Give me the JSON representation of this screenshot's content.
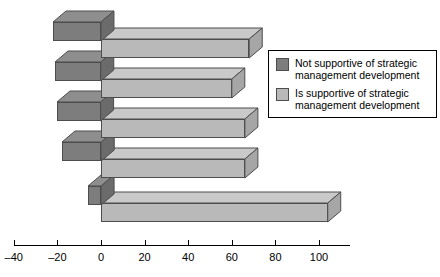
{
  "chart_data": {
    "type": "bar",
    "orientation": "horizontal",
    "style": "3d-stacked-rows",
    "title": "",
    "xlabel": "",
    "ylabel": "",
    "xlim": [
      -40,
      110
    ],
    "xticks": [
      -40,
      -20,
      0,
      20,
      40,
      60,
      80,
      100
    ],
    "xtick_labels": [
      "–40",
      "–20",
      "0",
      "20",
      "40",
      "60",
      "80",
      "100"
    ],
    "grid": false,
    "categories": [
      "Row 1",
      "Row 2",
      "Row 3",
      "Row 4",
      "Row 5"
    ],
    "series": [
      {
        "name": "Not supportive of strategic management development",
        "color": "#7d7d7d",
        "top_color": "#8e8e8e",
        "side_color": "#6b6b6b",
        "values": [
          -22,
          -21,
          -20,
          -18,
          -6
        ]
      },
      {
        "name": "Is supportive of strategic management development",
        "color": "#b9b9b9",
        "top_color": "#c9c9c9",
        "side_color": "#a6a6a6",
        "values": [
          68,
          60,
          66,
          66,
          104
        ]
      }
    ],
    "legend": {
      "position": "right",
      "entries": [
        {
          "label": "Not supportive of strategic\nmanagement development",
          "color": "#7d7d7d"
        },
        {
          "label": "Is supportive of strategic\nmanagement development",
          "color": "#b9b9b9"
        }
      ]
    }
  }
}
